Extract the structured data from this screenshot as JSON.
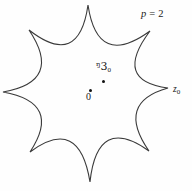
{
  "figure": {
    "background_color": "#fefefe",
    "stroke_color": "#3a3a3a",
    "dot_color": "#111111",
    "width": 192,
    "height": 191,
    "caption_note": "Eight-cusped star region with interior marked points"
  },
  "labels": {
    "parameter": {
      "variable": "p",
      "equals": "=",
      "value": "2",
      "full_text": "p = 2"
    },
    "boundary_point": {
      "text": "z",
      "subscript": "0",
      "full_text": "z0"
    },
    "origin_point": {
      "text": "0"
    },
    "interior_point": {
      "glyph": "ᵑ3",
      "subscript": "0",
      "full_text": "ᵑ30"
    }
  },
  "points": [
    {
      "name": "interior-point-dot",
      "x": 103,
      "y": 81
    },
    {
      "name": "origin-dot",
      "x": 90,
      "y": 90
    }
  ],
  "shape": {
    "type": "eight-cusped-star",
    "cusp_count": 8,
    "center": {
      "x": 88,
      "y": 92
    },
    "cusps": [
      {
        "angle_deg": 90,
        "x": 88,
        "y": 5
      },
      {
        "angle_deg": 45,
        "x": 150,
        "y": 31
      },
      {
        "angle_deg": 0,
        "x": 168,
        "y": 88
      },
      {
        "angle_deg": 315,
        "x": 149,
        "y": 151
      },
      {
        "angle_deg": 270,
        "x": 90,
        "y": 182
      },
      {
        "angle_deg": 225,
        "x": 30,
        "y": 152
      },
      {
        "angle_deg": 180,
        "x": 3,
        "y": 92
      },
      {
        "angle_deg": 135,
        "x": 29,
        "y": 30
      }
    ],
    "stroke_width": 1.1
  }
}
